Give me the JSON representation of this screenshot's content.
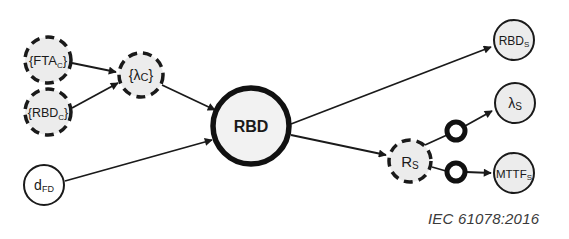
{
  "diagram": {
    "nodes": [
      {
        "id": "fta_c",
        "label": "{FTA",
        "sub": "C",
        "suffix": "}",
        "style": "dashed",
        "cx": 48,
        "cy": 60,
        "r": 24
      },
      {
        "id": "rbd_c",
        "label": "{RBD",
        "sub": "C",
        "suffix": "}",
        "style": "dashed",
        "cx": 48,
        "cy": 112,
        "r": 24
      },
      {
        "id": "lambda_c",
        "label": "{λ",
        "sub": "C",
        "suffix": "}",
        "style": "dashed",
        "cx": 141,
        "cy": 75,
        "r": 23
      },
      {
        "id": "d_fd",
        "label": "d",
        "sub": "FD",
        "suffix": "",
        "style": "solid",
        "cx": 44,
        "cy": 185,
        "r": 21
      },
      {
        "id": "rbd",
        "label": "RBD",
        "sub": "",
        "suffix": "",
        "style": "thick",
        "cx": 251,
        "cy": 126,
        "r": 40
      },
      {
        "id": "r_s",
        "label": "R",
        "sub": "S",
        "suffix": "",
        "style": "dashed",
        "cx": 410,
        "cy": 161,
        "r": 22
      },
      {
        "id": "rbd_s",
        "label": "RBD",
        "sub": "S",
        "suffix": "",
        "style": "solid",
        "cx": 514,
        "cy": 40,
        "r": 21
      },
      {
        "id": "lambda_s",
        "label": "λ",
        "sub": "S",
        "suffix": "",
        "style": "solid",
        "cx": 515,
        "cy": 103,
        "r": 21
      },
      {
        "id": "mttf_s",
        "label": "MTTF",
        "sub": "S",
        "suffix": "",
        "style": "solid",
        "cx": 514,
        "cy": 173,
        "r": 21
      }
    ],
    "edges": [
      {
        "from": "fta_c",
        "to": "lambda_c",
        "arrow": true
      },
      {
        "from": "rbd_c",
        "to": "lambda_c",
        "arrow": true
      },
      {
        "from": "lambda_c",
        "to": "rbd",
        "arrow": true
      },
      {
        "from": "d_fd",
        "to": "rbd",
        "arrow": true
      },
      {
        "from": "rbd",
        "to": "rbd_s",
        "arrow": true
      },
      {
        "from": "rbd",
        "to": "r_s",
        "arrow": true
      },
      {
        "from": "r_s",
        "to": "lambda_s",
        "arrow": true,
        "via_ring": true
      },
      {
        "from": "r_s",
        "to": "mttf_s",
        "arrow": true,
        "via_ring": true
      }
    ],
    "rings": [
      {
        "id": "ring_lambda_s",
        "cx": 456,
        "cy": 131,
        "r": 10
      },
      {
        "id": "ring_mttf_s",
        "cx": 456,
        "cy": 172,
        "r": 10
      }
    ],
    "colors": {
      "node_fill": "#ececec",
      "stroke": "#1a1a1a",
      "background": "#ffffff"
    }
  },
  "caption": "IEC 61078:2016"
}
